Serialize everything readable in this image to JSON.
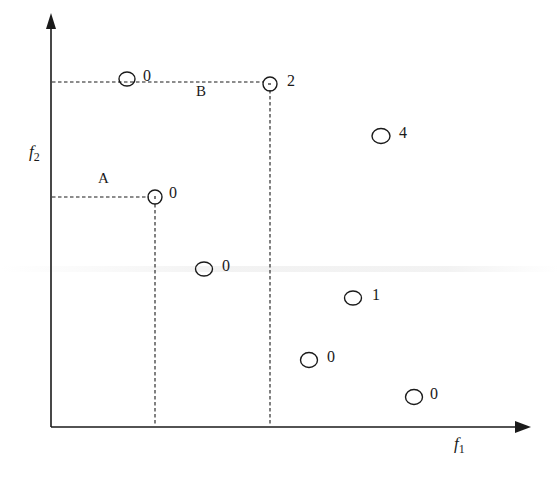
{
  "diagram": {
    "title": "",
    "axes": {
      "x": {
        "label_main": "f",
        "label_sub": "1"
      },
      "y": {
        "label_main": "f",
        "label_sub": "2"
      }
    },
    "highlighted": [
      {
        "label": "A",
        "point_index": 3
      },
      {
        "label": "B",
        "point_index": 1
      }
    ],
    "points": [
      {
        "x": 127,
        "y": 79,
        "value": "0"
      },
      {
        "x": 270,
        "y": 84,
        "value": "2"
      },
      {
        "x": 381,
        "y": 136,
        "value": "4"
      },
      {
        "x": 155,
        "y": 197,
        "value": "0"
      },
      {
        "x": 204,
        "y": 269,
        "value": "0"
      },
      {
        "x": 353,
        "y": 298,
        "value": "1"
      },
      {
        "x": 309,
        "y": 360,
        "value": "0"
      },
      {
        "x": 414,
        "y": 397,
        "value": "0"
      }
    ],
    "colors": {
      "ink": "#1a1a1a",
      "background": "#ffffff"
    }
  },
  "labels": {
    "A": "A",
    "B": "B",
    "p0": "0",
    "p1": "2",
    "p2": "4",
    "p3": "0",
    "p4": "0",
    "p5": "1",
    "p6": "0",
    "p7": "0",
    "f1_main": "f",
    "f1_sub": "1",
    "f2_main": "f",
    "f2_sub": "2"
  }
}
